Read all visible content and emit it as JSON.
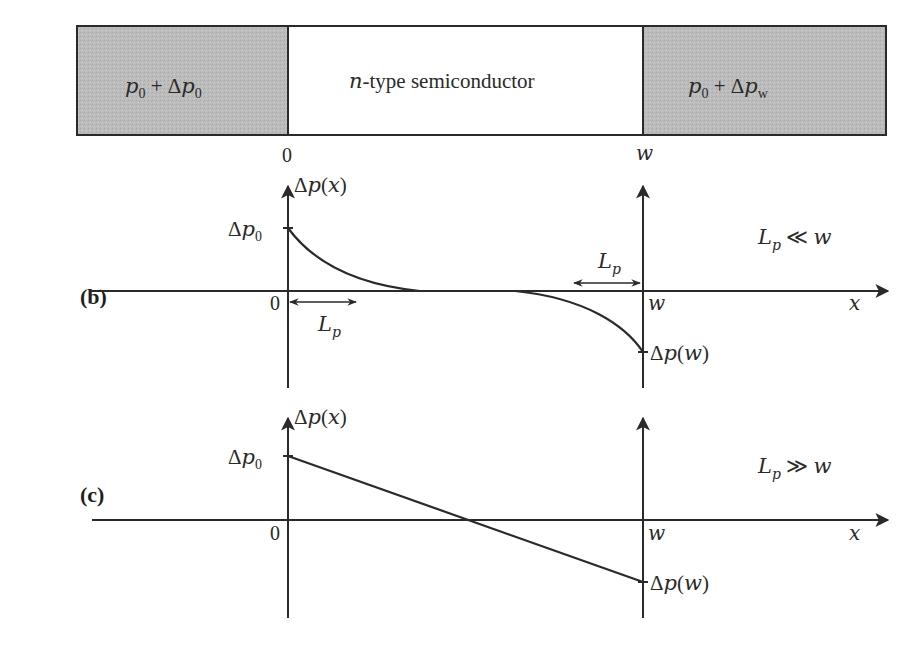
{
  "panels": {
    "a": {
      "label": "(a)",
      "left_region": {
        "text_main": "p",
        "sub_main": "0",
        "plus": " + Δ",
        "text_p": "p",
        "sub_p": "0"
      },
      "center_region": {
        "n": "n",
        "rest": "-type semiconductor"
      },
      "right_region": {
        "text_main": "p",
        "sub_main": "0",
        "plus": " + Δ",
        "text_p": "p",
        "sub_p": "w"
      },
      "tick_left": "0",
      "tick_right": "w"
    },
    "b": {
      "label": "(b)",
      "y_axis_label": {
        "delta": "Δ",
        "p": "p",
        "open": "(",
        "x": "x",
        "close": ")"
      },
      "left_value_label": {
        "delta": "Δ",
        "p": "p",
        "sub": "0"
      },
      "right_value_label": {
        "delta": "Δ",
        "p": "p",
        "open": "(",
        "w": "w",
        "close": ")"
      },
      "origin_label": "0",
      "w_label": "w",
      "x_axis_label": "x",
      "length_left": {
        "L": "L",
        "sub": "p"
      },
      "length_right": {
        "L": "L",
        "sub": "p"
      },
      "condition": {
        "L": "L",
        "sub": "p",
        "rel": " ≪ ",
        "w": "w"
      }
    },
    "c": {
      "label": "(c)",
      "y_axis_label": {
        "delta": "Δ",
        "p": "p",
        "open": "(",
        "x": "x",
        "close": ")"
      },
      "left_value_label": {
        "delta": "Δ",
        "p": "p",
        "sub": "0"
      },
      "right_value_label": {
        "delta": "Δ",
        "p": "p",
        "open": "(",
        "w": "w",
        "close": ")"
      },
      "origin_label": "0",
      "w_label": "w",
      "x_axis_label": "x",
      "condition": {
        "L": "L",
        "sub": "p",
        "rel": " ≫ ",
        "w": "w"
      }
    }
  },
  "colors": {
    "shade": "#bdbdbd",
    "line": "#2a2a2a",
    "background": "#ffffff"
  }
}
